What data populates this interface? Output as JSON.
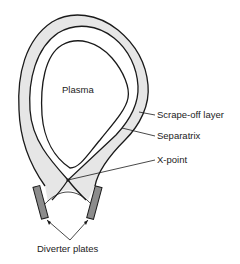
{
  "diagram": {
    "labels": {
      "plasma": "Plasma",
      "scrape_off_layer": "Scrape-off layer",
      "separatrix": "Separatrix",
      "x_point": "X-point",
      "diverter_plates": "Diverter plates"
    },
    "colors": {
      "scrape_off_fill": "#e6e6e6",
      "plate_fill": "#8c8c8c",
      "line": "#1a1a1a",
      "text": "#222222"
    }
  }
}
